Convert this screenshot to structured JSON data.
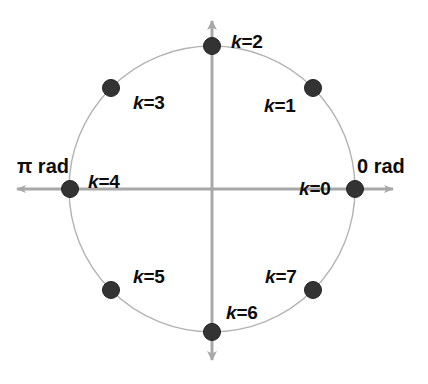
{
  "figure": {
    "background_color": "#ffffff",
    "axis_color": "#a8a8a8",
    "circle_color": "#b0b0b0",
    "point_color": "#333333",
    "text_color": "#0d0d0d"
  },
  "axes": {
    "center": {
      "x": 212,
      "y": 189
    },
    "horizontal": {
      "x_start": 8,
      "x_end": 401,
      "y": 189,
      "arrows": "both"
    },
    "vertical": {
      "y_start": 12,
      "y_end": 369,
      "x": 212,
      "arrows": "both"
    },
    "labels": {
      "left": {
        "text": "π rad",
        "x": 17,
        "y": 156
      },
      "right": {
        "text": "0 rad",
        "x": 357,
        "y": 156
      }
    }
  },
  "chart_data": {
    "type": "scatter",
    "xlabel": "",
    "ylabel": "",
    "grid": false,
    "legend": "none",
    "circle": {
      "center_x": 212,
      "center_y": 189,
      "radius": 143,
      "label": "unit circle"
    },
    "categories": [
      "k=0",
      "k=1",
      "k=2",
      "k=3",
      "k=4",
      "k=5",
      "k=6",
      "k=7"
    ],
    "angles_deg": [
      0,
      45,
      90,
      135,
      180,
      225,
      270,
      315
    ],
    "angles_rad": [
      "0",
      "π/4",
      "π/2",
      "3π/4",
      "π",
      "5π/4",
      "3π/2",
      "7π/4"
    ],
    "points": [
      {
        "k": 0,
        "label_k": "k",
        "label_eq": "=0",
        "angle_deg": 0,
        "x": 355,
        "y": 189,
        "label_x": 299,
        "label_y": 179,
        "label_align": "left"
      },
      {
        "k": 1,
        "label_k": "k",
        "label_eq": "=1",
        "angle_deg": 45,
        "x": 313,
        "y": 88,
        "label_x": 264,
        "label_y": 96,
        "label_align": "left"
      },
      {
        "k": 2,
        "label_k": "k",
        "label_eq": "=2",
        "angle_deg": 90,
        "x": 212,
        "y": 46,
        "label_x": 231,
        "label_y": 32,
        "label_align": "left"
      },
      {
        "k": 3,
        "label_k": "k",
        "label_eq": "=3",
        "angle_deg": 135,
        "x": 111,
        "y": 88,
        "label_x": 133,
        "label_y": 93,
        "label_align": "left"
      },
      {
        "k": 4,
        "label_k": "k",
        "label_eq": "=4",
        "angle_deg": 180,
        "x": 70,
        "y": 189,
        "label_x": 88,
        "label_y": 172,
        "label_align": "left"
      },
      {
        "k": 5,
        "label_k": "k",
        "label_eq": "=5",
        "angle_deg": 225,
        "x": 111,
        "y": 290,
        "label_x": 133,
        "label_y": 267,
        "label_align": "left"
      },
      {
        "k": 6,
        "label_k": "k",
        "label_eq": "=6",
        "angle_deg": 270,
        "x": 212,
        "y": 332,
        "label_x": 226,
        "label_y": 303,
        "label_align": "left"
      },
      {
        "k": 7,
        "label_k": "k",
        "label_eq": "=7",
        "angle_deg": 315,
        "x": 313,
        "y": 290,
        "label_x": 265,
        "label_y": 267,
        "label_align": "left"
      }
    ]
  }
}
